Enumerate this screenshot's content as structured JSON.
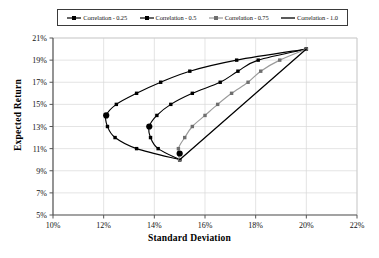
{
  "chart_data": {
    "type": "line",
    "title": "",
    "xlabel": "Standard Deviation",
    "ylabel": "Expected Return",
    "xlim": [
      10,
      22
    ],
    "ylim": [
      5,
      21
    ],
    "xticks": [
      "10%",
      "12%",
      "14%",
      "16%",
      "18%",
      "20%",
      "22%"
    ],
    "yticks": [
      "5%",
      "7%",
      "9%",
      "11%",
      "13%",
      "15%",
      "17%",
      "19%",
      "21%"
    ],
    "xtick_values": [
      10,
      12,
      14,
      16,
      18,
      20,
      22
    ],
    "ytick_values": [
      5,
      7,
      9,
      11,
      13,
      15,
      17,
      19,
      21
    ],
    "grid": true,
    "legend_position": "top",
    "series": [
      {
        "name": "Correlation - 0.25",
        "color": "#000000",
        "marker": "square",
        "points": [
          {
            "x": 15.0,
            "y": 10.0
          },
          {
            "x": 13.3,
            "y": 11.0
          },
          {
            "x": 12.45,
            "y": 12.0
          },
          {
            "x": 12.15,
            "y": 13.0
          },
          {
            "x": 12.1,
            "y": 14.0
          },
          {
            "x": 12.5,
            "y": 15.0
          },
          {
            "x": 13.3,
            "y": 16.0
          },
          {
            "x": 14.25,
            "y": 17.0
          },
          {
            "x": 15.4,
            "y": 18.0
          },
          {
            "x": 17.25,
            "y": 19.0
          },
          {
            "x": 20.0,
            "y": 20.0
          }
        ],
        "highlight_point": {
          "x": 12.1,
          "y": 14.0
        }
      },
      {
        "name": "Correlation - 0.5",
        "color": "#000000",
        "marker": "square",
        "points": [
          {
            "x": 15.0,
            "y": 10.0
          },
          {
            "x": 14.15,
            "y": 11.0
          },
          {
            "x": 13.85,
            "y": 12.0
          },
          {
            "x": 13.8,
            "y": 13.0
          },
          {
            "x": 14.1,
            "y": 14.0
          },
          {
            "x": 14.65,
            "y": 15.0
          },
          {
            "x": 15.5,
            "y": 16.0
          },
          {
            "x": 16.6,
            "y": 17.0
          },
          {
            "x": 17.3,
            "y": 18.0
          },
          {
            "x": 18.1,
            "y": 19.0
          },
          {
            "x": 20.0,
            "y": 20.0
          }
        ],
        "highlight_point": {
          "x": 13.8,
          "y": 13.0
        }
      },
      {
        "name": "Correlation - 0.75",
        "color": "#9a9a9a",
        "marker": "square",
        "points": [
          {
            "x": 15.0,
            "y": 10.0
          },
          {
            "x": 14.95,
            "y": 11.0
          },
          {
            "x": 15.2,
            "y": 12.0
          },
          {
            "x": 15.5,
            "y": 13.0
          },
          {
            "x": 16.0,
            "y": 14.0
          },
          {
            "x": 16.5,
            "y": 15.0
          },
          {
            "x": 17.05,
            "y": 16.0
          },
          {
            "x": 17.7,
            "y": 17.0
          },
          {
            "x": 18.2,
            "y": 18.0
          },
          {
            "x": 18.95,
            "y": 19.0
          },
          {
            "x": 20.0,
            "y": 20.0
          }
        ],
        "highlight_point": null
      },
      {
        "name": "Correlation - 1.0",
        "color": "#000000",
        "marker": "none",
        "points": [
          {
            "x": 15.0,
            "y": 10.0
          },
          {
            "x": 20.0,
            "y": 20.0
          }
        ],
        "highlight_point": null
      }
    ],
    "annotations": [
      {
        "label": "convergence-low",
        "x": 15.0,
        "y": 10.0
      },
      {
        "label": "convergence-high",
        "x": 20.0,
        "y": 20.0
      }
    ]
  }
}
